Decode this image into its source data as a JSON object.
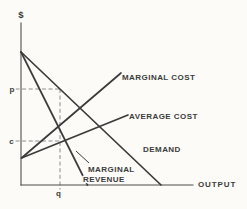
{
  "figure": {
    "title_semantic": "monopoly-cost-revenue-diagram",
    "colors": {
      "background": "#fcfbf8",
      "ink": "#3b3b3b",
      "axis": "#4d4d4d",
      "dashed_guide": "#8c8c8c"
    },
    "axis": {
      "y_label": "$",
      "x_label": "OUTPUT",
      "origin": {
        "x": 21,
        "y": 185
      },
      "y_top": 23,
      "x_right": 193
    },
    "curves": [
      {
        "id": "marginal-cost",
        "label": "MARGINAL COST",
        "x1": 21.5,
        "y1": 158,
        "x2": 121,
        "y2": 73
      },
      {
        "id": "average-cost",
        "label": "AVERAGE COST",
        "x1": 21.5,
        "y1": 158,
        "x2": 128,
        "y2": 115
      },
      {
        "id": "demand",
        "label": "DEMAND",
        "x1": 21,
        "y1": 52,
        "x2": 161,
        "y2": 185
      },
      {
        "id": "marginal-revenue",
        "label": "MARGINAL REVENUE",
        "label_lines": [
          "MARGINAL",
          "REVENUE"
        ],
        "x1": 21,
        "y1": 52,
        "x2": 87.5,
        "y2": 185
      }
    ],
    "pointer": {
      "x1": 76,
      "y1": 151,
      "x2": 89,
      "y2": 163
    },
    "guides": {
      "p": {
        "label": "p",
        "y": 89,
        "x_from": 15.5
      },
      "c": {
        "label": "c",
        "y": 141,
        "x_from": 15.5
      },
      "q": {
        "label": "q",
        "x": 60,
        "y_from": 89,
        "y_to": 189.5
      }
    }
  }
}
